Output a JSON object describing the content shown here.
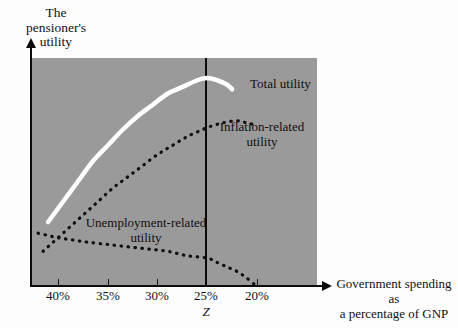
{
  "chart_data": {
    "type": "line",
    "title": "",
    "ylabel": "The\npensioner's\nutility",
    "xlabel": "Government spending as\na percentage of GNP",
    "xticklabels": [
      "40%",
      "35%",
      "30%",
      "25%",
      "20%"
    ],
    "xtickvalues": [
      40,
      35,
      30,
      25,
      20
    ],
    "xlim": [
      42,
      18
    ],
    "ylim": [
      0,
      100
    ],
    "grid": false,
    "legend_position": "inline-annotations",
    "plot_background": "#9a9a9a",
    "annotations": [
      {
        "text": "Total utility",
        "series": "total-utility"
      },
      {
        "text": "Inflation-related\nutility",
        "series": "inflation-related-utility"
      },
      {
        "text": "Unemployment-related\nutility",
        "series": "unemployment-related-utility"
      }
    ],
    "vertical_marker": {
      "label": "Z",
      "x": 25,
      "color": "#0a0a0a"
    },
    "series": [
      {
        "name": "Total utility",
        "style": "solid",
        "color": "#ffffff",
        "x": [
          41.0,
          39.5,
          38.0,
          36.5,
          35.0,
          33.5,
          32.0,
          30.5,
          29.0,
          27.5,
          26.0,
          25.0,
          24.0,
          23.0,
          22.5
        ],
        "values": [
          28,
          37,
          46,
          55,
          62,
          69,
          75,
          80,
          85,
          88,
          91,
          92,
          91,
          89,
          87
        ]
      },
      {
        "name": "Inflation-related utility",
        "style": "dotted",
        "color": "#101010",
        "x": [
          41.5,
          40.5,
          39.0,
          37.5,
          36.0,
          34.5,
          33.0,
          31.5,
          30.0,
          28.5,
          27.0,
          25.5,
          25.0,
          23.5,
          22.0,
          21.0,
          20.0
        ],
        "values": [
          15,
          19,
          25,
          31,
          37,
          43,
          48,
          53,
          58,
          62,
          66,
          69,
          70,
          72,
          73,
          72,
          71
        ]
      },
      {
        "name": "Unemployment-related utility",
        "style": "dotted",
        "color": "#101010",
        "x": [
          42.0,
          41.0,
          40.0,
          38.5,
          37.0,
          35.0,
          33.0,
          31.0,
          29.0,
          27.0,
          25.0,
          24.0,
          23.0,
          22.0,
          21.0,
          20.2
        ],
        "values": [
          23,
          22,
          21,
          20,
          19,
          18,
          17,
          16,
          15,
          13,
          12,
          10,
          8,
          6,
          3,
          0
        ]
      }
    ]
  },
  "axes": {
    "y_label": "The\npensioner's\nutility",
    "x_label": "Government spending as\na percentage of GNP",
    "ticks": [
      {
        "label": "40%",
        "px": 58
      },
      {
        "label": "35%",
        "px": 108
      },
      {
        "label": "30%",
        "px": 157
      },
      {
        "label": "25%",
        "px": 206
      },
      {
        "label": "20%",
        "px": 257
      }
    ],
    "marker_label": "Z"
  },
  "labels": {
    "total_utility": "Total utility",
    "inflation_utility": "Inflation-related\nutility",
    "unemployment_utility": "Unemployment-related\nutility"
  }
}
